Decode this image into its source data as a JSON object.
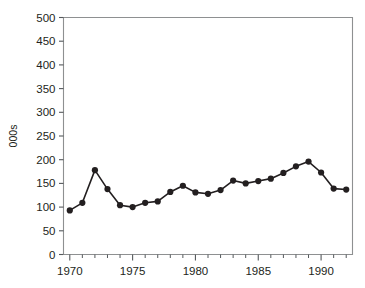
{
  "chart_data": {
    "type": "line",
    "title": "",
    "xlabel": "",
    "ylabel": "000s",
    "xlim": [
      1969.5,
      1992.5
    ],
    "ylim": [
      0,
      500
    ],
    "grid": false,
    "legend": null,
    "y_ticks": [
      0,
      50,
      100,
      150,
      200,
      250,
      300,
      350,
      400,
      450,
      500
    ],
    "y_tick_labels": [
      "0",
      "50",
      "100",
      "150",
      "200",
      "250",
      "300",
      "350",
      "400",
      "450",
      "500"
    ],
    "x_ticks": [
      1970,
      1975,
      1980,
      1985,
      1990
    ],
    "x_tick_labels": [
      "1970",
      "1975",
      "1980",
      "1985",
      "1990"
    ],
    "x_minor_ticks": [
      1971,
      1972,
      1973,
      1974,
      1976,
      1977,
      1978,
      1979,
      1981,
      1982,
      1983,
      1984,
      1986,
      1987,
      1988,
      1989,
      1991,
      1992
    ],
    "x": [
      1970,
      1971,
      1972,
      1973,
      1974,
      1975,
      1976,
      1977,
      1978,
      1979,
      1980,
      1981,
      1982,
      1983,
      1984,
      1985,
      1986,
      1987,
      1988,
      1989,
      1990,
      1991,
      1992
    ],
    "values": [
      93,
      109,
      178,
      138,
      104,
      100,
      109,
      112,
      132,
      145,
      131,
      128,
      136,
      156,
      150,
      155,
      160,
      172,
      186,
      196,
      173,
      139,
      137
    ],
    "series": [
      {
        "name": "series-1",
        "values": [
          93,
          109,
          178,
          138,
          104,
          100,
          109,
          112,
          132,
          145,
          131,
          128,
          136,
          156,
          150,
          155,
          160,
          172,
          186,
          196,
          173,
          139,
          137
        ],
        "color": "#231f20",
        "marker": "circle"
      }
    ],
    "colors": {
      "line": "#231f20",
      "marker": "#231f20",
      "frame": "#8e9091",
      "text": "#231f20",
      "background": "#ffffff"
    }
  }
}
